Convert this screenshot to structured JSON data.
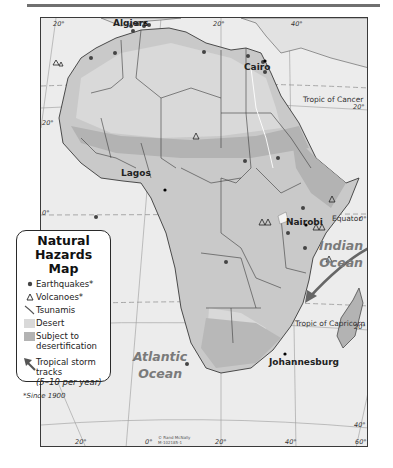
{
  "map": {
    "title": "Natural Hazards Map",
    "colors": {
      "ocean": "#ececec",
      "land": "#c9c9c9",
      "desert": "#d9d9d9",
      "desertification": "#b3b3b3",
      "border": "#3a3a3a",
      "marker": "#444444"
    },
    "cities": [
      {
        "name": "Algiers",
        "x": 114,
        "y": 12
      },
      {
        "name": "Cairo",
        "x": 248,
        "y": 45
      },
      {
        "name": "Lagos",
        "x": 136,
        "y": 172
      },
      {
        "name": "Nairobi",
        "x": 288,
        "y": 205
      },
      {
        "name": "Johannesburg",
        "x": 257,
        "y": 346
      }
    ],
    "parallels": [
      {
        "name": "Tropic of Cancer",
        "x": 302,
        "y": 86
      },
      {
        "name": "Equator",
        "x": 330,
        "y": 204
      },
      {
        "name": "Tropic of Capricorn",
        "x": 296,
        "y": 317
      }
    ],
    "oceans": [
      {
        "name_line1": "Indian",
        "name_line2": "Ocean"
      },
      {
        "name_line1": "Atlantic",
        "name_line2": "Ocean"
      }
    ],
    "ticks": {
      "top": [
        "20°",
        "0°",
        "20°",
        "40°"
      ],
      "right": [
        "20°",
        "0°",
        "20°",
        "40°"
      ],
      "bottom": [
        "20°",
        "0°",
        "20°",
        "40°",
        "60°"
      ],
      "left": [
        "20°",
        "0°"
      ]
    },
    "credit_line1": "© Rand McNally",
    "credit_line2": "M-102185-1"
  },
  "legend": {
    "title_line1": "Natural",
    "title_line2": "Hazards Map",
    "items": [
      {
        "symbol": "earthquake-dot",
        "label": "Earthquakes*"
      },
      {
        "symbol": "volcano-triangle",
        "label": "Volcanoes*"
      },
      {
        "symbol": "tsunami-line",
        "label": "Tsunamis"
      },
      {
        "symbol": "desert-swatch",
        "label": "Desert"
      },
      {
        "symbol": "desertification-swatch",
        "label_line1": "Subject to",
        "label_line2": "desertification"
      },
      {
        "symbol": "storm-arrow",
        "label_line1": "Tropical storm",
        "label_line2": "tracks",
        "label_line3": "(5–10 per year)"
      }
    ],
    "footnote": "*Since 1900"
  }
}
